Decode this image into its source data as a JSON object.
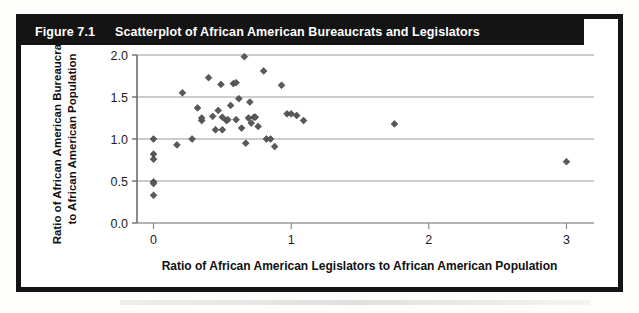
{
  "figure": {
    "number_label": "Figure 7.1",
    "title": "Scatterplot of African American Bureaucrats and Legislators"
  },
  "chart_data": {
    "type": "scatter",
    "title": "Scatterplot of African American Bureaucrats and Legislators",
    "xlabel": "Ratio of African American Legislators to African American Population",
    "ylabel_line1": "Ratio of African American Bureaucrats",
    "ylabel_line2": "to African American Population",
    "xlim": [
      -0.12,
      3.2
    ],
    "ylim": [
      0.0,
      2.0
    ],
    "xticks": [
      0,
      1,
      2,
      3
    ],
    "xtick_labels": [
      "0",
      "1",
      "2",
      "3"
    ],
    "yticks": [
      0.0,
      0.5,
      1.0,
      1.5,
      2.0
    ],
    "ytick_labels": [
      "0.0",
      "0.5",
      "1.0",
      "1.5",
      "2.0"
    ],
    "grid": "horizontal",
    "legend": "none",
    "marker": "diamond",
    "marker_color": "#59595b",
    "points": [
      {
        "x": 0.0,
        "y": 1.0
      },
      {
        "x": 0.0,
        "y": 0.82
      },
      {
        "x": 0.0,
        "y": 0.76
      },
      {
        "x": 0.0,
        "y": 0.49
      },
      {
        "x": 0.0,
        "y": 0.47
      },
      {
        "x": 0.0,
        "y": 0.33
      },
      {
        "x": 0.17,
        "y": 0.93
      },
      {
        "x": 0.21,
        "y": 1.55
      },
      {
        "x": 0.28,
        "y": 1.0
      },
      {
        "x": 0.32,
        "y": 1.37
      },
      {
        "x": 0.35,
        "y": 1.22
      },
      {
        "x": 0.35,
        "y": 1.25
      },
      {
        "x": 0.4,
        "y": 1.73
      },
      {
        "x": 0.43,
        "y": 1.27
      },
      {
        "x": 0.45,
        "y": 1.11
      },
      {
        "x": 0.47,
        "y": 1.34
      },
      {
        "x": 0.49,
        "y": 1.65
      },
      {
        "x": 0.5,
        "y": 1.26
      },
      {
        "x": 0.5,
        "y": 1.11
      },
      {
        "x": 0.53,
        "y": 1.22
      },
      {
        "x": 0.54,
        "y": 1.23
      },
      {
        "x": 0.56,
        "y": 1.4
      },
      {
        "x": 0.58,
        "y": 1.66
      },
      {
        "x": 0.6,
        "y": 1.67
      },
      {
        "x": 0.6,
        "y": 1.23
      },
      {
        "x": 0.62,
        "y": 1.48
      },
      {
        "x": 0.64,
        "y": 1.13
      },
      {
        "x": 0.66,
        "y": 1.98
      },
      {
        "x": 0.67,
        "y": 0.95
      },
      {
        "x": 0.69,
        "y": 1.25
      },
      {
        "x": 0.7,
        "y": 1.44
      },
      {
        "x": 0.71,
        "y": 1.19
      },
      {
        "x": 0.73,
        "y": 1.26
      },
      {
        "x": 0.74,
        "y": 1.26
      },
      {
        "x": 0.76,
        "y": 1.15
      },
      {
        "x": 0.8,
        "y": 1.81
      },
      {
        "x": 0.82,
        "y": 1.0
      },
      {
        "x": 0.85,
        "y": 1.0
      },
      {
        "x": 0.88,
        "y": 0.91
      },
      {
        "x": 0.93,
        "y": 1.64
      },
      {
        "x": 0.97,
        "y": 1.3
      },
      {
        "x": 1.0,
        "y": 1.3
      },
      {
        "x": 1.04,
        "y": 1.28
      },
      {
        "x": 1.09,
        "y": 1.22
      },
      {
        "x": 1.75,
        "y": 1.18
      },
      {
        "x": 3.0,
        "y": 0.73
      }
    ]
  },
  "icons": {
    "data_point": "diamond-marker"
  }
}
